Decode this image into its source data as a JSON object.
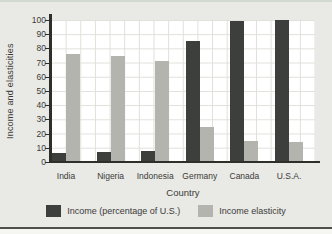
{
  "figure": {
    "background": "#e9e9e6",
    "plot_background": "#ffffff",
    "grid_color": "#dfe0da",
    "axis_color": "#2e2e2a",
    "text_color": "#3b3b36",
    "top_rule_color": "#d2d9d1",
    "bottom_rule_color": "#50504a"
  },
  "chart_data": {
    "type": "bar",
    "title": "",
    "xlabel": "Country",
    "ylabel": "Income and elasticities",
    "ylim": [
      0,
      100
    ],
    "yticks": [
      0,
      10,
      20,
      30,
      40,
      50,
      60,
      70,
      80,
      90,
      100
    ],
    "grid": true,
    "legend_position": "bottom",
    "categories": [
      "India",
      "Nigeria",
      "Indonesia",
      "Germany",
      "Canada",
      "U.S.A."
    ],
    "series": [
      {
        "name": "Income (percentage of U.S.)",
        "color": "#3d3f3c",
        "values": [
          6,
          7,
          8,
          85,
          99,
          100
        ]
      },
      {
        "name": "Income elasticity",
        "color": "#b3b4ae",
        "values": [
          76,
          75,
          71,
          25,
          15,
          14
        ]
      }
    ]
  }
}
